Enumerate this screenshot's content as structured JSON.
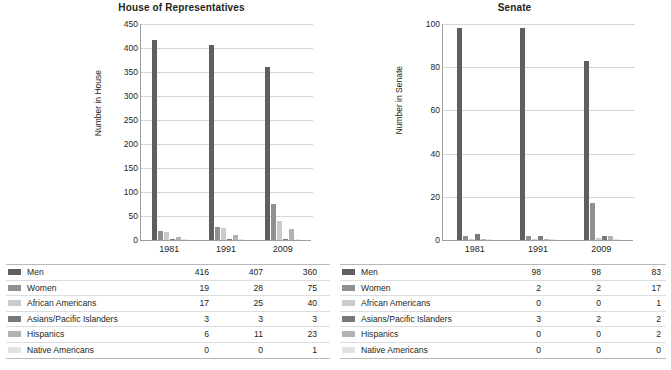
{
  "colors": {
    "men": "#5d5f61",
    "women": "#8e9092",
    "african_americans": "#c9cbcd",
    "asians_pacific_islanders": "#77797b",
    "hispanics": "#b0b2b4",
    "native_americans": "#e0e2e4",
    "axis": "#9d9fa2",
    "grid": "#d4d5d7",
    "text": "#231f20"
  },
  "series_names": [
    "Men",
    "Women",
    "African Americans",
    "Asians/Pacific Islanders",
    "Hispanics",
    "Native Americans"
  ],
  "chart_data": [
    {
      "type": "bar",
      "title": "House of Representatives",
      "xlabel": "",
      "ylabel": "Number in House",
      "categories": [
        "1981",
        "1991",
        "2009"
      ],
      "ylim": [
        0,
        450
      ],
      "yticks": [
        0,
        50,
        100,
        150,
        200,
        250,
        300,
        350,
        400,
        450
      ],
      "grid": true,
      "legend": "table-below",
      "series": [
        {
          "name": "Men",
          "values": [
            416,
            407,
            360
          ]
        },
        {
          "name": "Women",
          "values": [
            19,
            28,
            75
          ]
        },
        {
          "name": "African Americans",
          "values": [
            17,
            25,
            40
          ]
        },
        {
          "name": "Asians/Pacific Islanders",
          "values": [
            3,
            3,
            3
          ]
        },
        {
          "name": "Hispanics",
          "values": [
            6,
            11,
            23
          ]
        },
        {
          "name": "Native Americans",
          "values": [
            0,
            0,
            1
          ]
        }
      ]
    },
    {
      "type": "bar",
      "title": "Senate",
      "xlabel": "",
      "ylabel": "Number in Senate",
      "categories": [
        "1981",
        "1991",
        "2009"
      ],
      "ylim": [
        0,
        100
      ],
      "yticks": [
        0,
        20,
        40,
        60,
        80,
        100
      ],
      "grid": true,
      "legend": "table-below",
      "series": [
        {
          "name": "Men",
          "values": [
            98,
            98,
            83
          ]
        },
        {
          "name": "Women",
          "values": [
            2,
            2,
            17
          ]
        },
        {
          "name": "African Americans",
          "values": [
            0,
            0,
            1
          ]
        },
        {
          "name": "Asians/Pacific Islanders",
          "values": [
            3,
            2,
            2
          ]
        },
        {
          "name": "Hispanics",
          "values": [
            0,
            0,
            2
          ]
        },
        {
          "name": "Native Americans",
          "values": [
            0,
            0,
            0
          ]
        }
      ]
    }
  ]
}
